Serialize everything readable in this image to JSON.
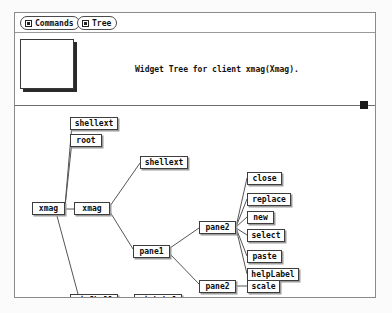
{
  "window": {
    "title_text": "Widget Tree for client xmag(Xmag)."
  },
  "menubar": {
    "items": [
      {
        "label": "Commands",
        "icon": "menu-box-icon"
      },
      {
        "label": "Tree",
        "icon": "menu-box-icon"
      }
    ]
  },
  "panner": {
    "name": "panner-box"
  },
  "scrollbar": {
    "orientation": "horizontal",
    "thumb": "scroll-thumb"
  },
  "colors": {
    "window_bg": "#ffffff",
    "page_bg": "#fbfbfb",
    "node_border": "#3d3d3d",
    "node_shadow": "#9c9c9c",
    "line": "#555555",
    "text": "#0c0c0c",
    "thumb": "#1a1a1a"
  },
  "tree": {
    "nodes": [
      {
        "id": "n0",
        "label": "shellext",
        "x": 55,
        "y": 11,
        "w": 48
      },
      {
        "id": "n1",
        "label": "root",
        "x": 55,
        "y": 28,
        "w": 32
      },
      {
        "id": "n2",
        "label": "xmag",
        "x": 17,
        "y": 96,
        "w": 33
      },
      {
        "id": "n3",
        "label": "xmag",
        "x": 59,
        "y": 96,
        "w": 36
      },
      {
        "id": "n4",
        "label": "shellext",
        "x": 125,
        "y": 50,
        "w": 48
      },
      {
        "id": "n5",
        "label": "pane1",
        "x": 118,
        "y": 139,
        "w": 37
      },
      {
        "id": "n6",
        "label": "pane2",
        "x": 184,
        "y": 115,
        "w": 37
      },
      {
        "id": "n7",
        "label": "pane2",
        "x": 184,
        "y": 174,
        "w": 37
      },
      {
        "id": "n8",
        "label": "close",
        "x": 232,
        "y": 66,
        "w": 35
      },
      {
        "id": "n9",
        "label": "replace",
        "x": 232,
        "y": 87,
        "w": 44
      },
      {
        "id": "n10",
        "label": "new",
        "x": 232,
        "y": 105,
        "w": 27
      },
      {
        "id": "n11",
        "label": "select",
        "x": 232,
        "y": 123,
        "w": 38
      },
      {
        "id": "n12",
        "label": "paste",
        "x": 232,
        "y": 144,
        "w": 35
      },
      {
        "id": "n13",
        "label": "helpLabel",
        "x": 232,
        "y": 162,
        "w": 52
      },
      {
        "id": "n14",
        "label": "scale",
        "x": 232,
        "y": 174,
        "w": 33
      },
      {
        "id": "n15",
        "label": "pixShell",
        "x": 55,
        "y": 188,
        "w": 48
      },
      {
        "id": "n16",
        "label": "pixLabel",
        "x": 119,
        "y": 188,
        "w": 48
      }
    ],
    "edges": [
      {
        "from": "xmag-left",
        "to": "shellext-top",
        "x1": 50,
        "y1": 100,
        "x2": 57,
        "y2": 18
      },
      {
        "from": "xmag-left",
        "to": "root",
        "x1": 50,
        "y1": 101,
        "x2": 57,
        "y2": 35
      },
      {
        "from": "xmag-left",
        "to": "xmag-right",
        "x1": 50,
        "y1": 103,
        "x2": 59,
        "y2": 103
      },
      {
        "from": "xmag-right",
        "to": "shellext-mid",
        "x1": 95,
        "y1": 100,
        "x2": 125,
        "y2": 57
      },
      {
        "from": "xmag-right",
        "to": "pane1",
        "x1": 95,
        "y1": 106,
        "x2": 118,
        "y2": 143
      },
      {
        "from": "xmag-left",
        "to": "pixShell",
        "x1": 42,
        "y1": 110,
        "x2": 63,
        "y2": 188
      },
      {
        "from": "pane1",
        "to": "pane2-upper",
        "x1": 155,
        "y1": 142,
        "x2": 184,
        "y2": 122
      },
      {
        "from": "pane1",
        "to": "pane2-lower",
        "x1": 155,
        "y1": 148,
        "x2": 184,
        "y2": 178
      },
      {
        "from": "pane2-upper",
        "to": "close",
        "x1": 221,
        "y1": 121,
        "x2": 232,
        "y2": 72
      },
      {
        "from": "pane2-upper",
        "to": "replace",
        "x1": 221,
        "y1": 121,
        "x2": 232,
        "y2": 93
      },
      {
        "from": "pane2-upper",
        "to": "new",
        "x1": 221,
        "y1": 121,
        "x2": 232,
        "y2": 111
      },
      {
        "from": "pane2-upper",
        "to": "select",
        "x1": 221,
        "y1": 122,
        "x2": 232,
        "y2": 129
      },
      {
        "from": "pane2-upper",
        "to": "paste",
        "x1": 221,
        "y1": 122,
        "x2": 232,
        "y2": 150
      },
      {
        "from": "pane2-upper",
        "to": "helpLabel",
        "x1": 221,
        "y1": 122,
        "x2": 232,
        "y2": 168
      },
      {
        "from": "pane2-lower",
        "to": "scale",
        "x1": 221,
        "y1": 180,
        "x2": 232,
        "y2": 180
      },
      {
        "from": "pixShell",
        "to": "pixLabel",
        "x1": 103,
        "y1": 194,
        "x2": 119,
        "y2": 194
      }
    ]
  }
}
